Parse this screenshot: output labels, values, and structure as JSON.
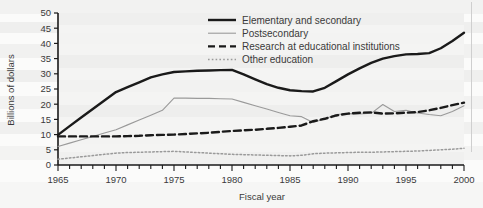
{
  "chart_data": {
    "type": "line",
    "title": "",
    "xlabel": "Fiscal year",
    "ylabel": "Billions of dollars",
    "xlim": [
      1965,
      2000
    ],
    "ylim": [
      0,
      50
    ],
    "ytick_labels": [
      "0",
      "5",
      "10",
      "15",
      "20",
      "25",
      "30",
      "35",
      "40",
      "45",
      "50"
    ],
    "ytick_values": [
      0,
      5,
      10,
      15,
      20,
      25,
      30,
      35,
      40,
      45,
      50
    ],
    "xtick_labels": [
      "1965",
      "1970",
      "1975",
      "1980",
      "1985",
      "1990",
      "1995",
      "2000"
    ],
    "xtick_values": [
      1965,
      1970,
      1975,
      1980,
      1985,
      1990,
      1995,
      2000
    ],
    "minor_xticks_every": 1,
    "grid": false,
    "legend_position": "upper-center",
    "x": [
      1965,
      1966,
      1967,
      1968,
      1969,
      1970,
      1971,
      1972,
      1973,
      1974,
      1975,
      1976,
      1977,
      1978,
      1979,
      1980,
      1981,
      1982,
      1983,
      1984,
      1985,
      1986,
      1987,
      1988,
      1989,
      1990,
      1991,
      1992,
      1993,
      1994,
      1995,
      1996,
      1997,
      1998,
      1999,
      2000
    ],
    "series": [
      {
        "name": "Elementary and secondary",
        "style": "solid-thick-black",
        "color": "#1a1a1a",
        "values": [
          9.9,
          12.8,
          15.6,
          18.4,
          21.2,
          24.0,
          25.6,
          27.2,
          28.8,
          29.8,
          30.6,
          30.8,
          31.0,
          31.1,
          31.2,
          31.3,
          29.8,
          28.2,
          26.6,
          25.4,
          24.6,
          24.3,
          24.2,
          25.4,
          27.6,
          29.8,
          31.8,
          33.6,
          35.0,
          35.8,
          36.4,
          36.5,
          36.8,
          38.4,
          40.8,
          43.5
        ]
      },
      {
        "name": "Postsecondary",
        "style": "solid-thin-gray",
        "color": "#9a9a9a",
        "values": [
          6.1,
          7.2,
          8.3,
          9.4,
          10.5,
          11.6,
          13.2,
          14.8,
          16.4,
          18.0,
          22.0,
          22.0,
          21.9,
          21.9,
          21.8,
          21.7,
          20.6,
          19.5,
          18.4,
          17.3,
          16.2,
          15.9,
          14.0,
          15.2,
          16.6,
          16.9,
          16.8,
          17.0,
          19.9,
          17.6,
          18.0,
          17.1,
          16.6,
          16.2,
          17.6,
          19.5
        ]
      },
      {
        "name": "Research at educational institutions",
        "style": "dashed-thick-black",
        "color": "#1a1a1a",
        "values": [
          9.4,
          9.4,
          9.4,
          9.4,
          9.4,
          9.4,
          9.5,
          9.6,
          9.8,
          9.9,
          10.0,
          10.2,
          10.4,
          10.6,
          10.9,
          11.2,
          11.4,
          11.6,
          11.9,
          12.2,
          12.6,
          13.0,
          14.4,
          15.2,
          16.3,
          16.9,
          17.2,
          17.3,
          16.9,
          17.0,
          17.2,
          17.4,
          18.0,
          18.8,
          19.7,
          20.5
        ]
      },
      {
        "name": "Other education",
        "style": "dotted-gray",
        "color": "#9a9a9a",
        "values": [
          1.9,
          2.3,
          2.7,
          3.1,
          3.5,
          3.9,
          4.1,
          4.2,
          4.3,
          4.4,
          4.5,
          4.3,
          4.1,
          3.9,
          3.7,
          3.5,
          3.4,
          3.3,
          3.2,
          3.1,
          3.0,
          3.2,
          3.7,
          3.9,
          4.0,
          4.1,
          4.2,
          4.2,
          4.3,
          4.4,
          4.5,
          4.6,
          4.8,
          5.0,
          5.2,
          5.5
        ]
      }
    ]
  },
  "legend": {
    "items": [
      {
        "label": "Elementary and secondary"
      },
      {
        "label": "Postsecondary"
      },
      {
        "label": "Research at educational institutions"
      },
      {
        "label": "Other education"
      }
    ]
  }
}
